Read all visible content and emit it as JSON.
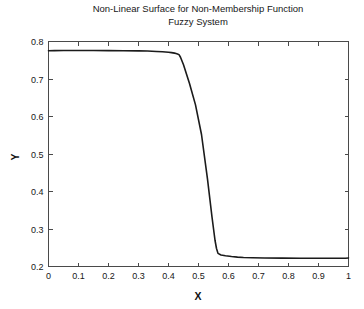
{
  "figure": {
    "background": "#ffffff",
    "width": 364,
    "height": 309
  },
  "chart_data": {
    "type": "line",
    "title": "Non-Linear Surface for Non-Membership Function Fuzzy System",
    "title_lines": [
      "Non-Linear Surface for Non-Membership Function",
      "Fuzzy System"
    ],
    "xlabel": "X",
    "ylabel": "Y",
    "xlim": [
      0,
      1
    ],
    "ylim": [
      0.2,
      0.8
    ],
    "xticks": [
      0,
      0.1,
      0.2,
      0.3,
      0.4,
      0.5,
      0.6,
      0.7,
      0.8,
      0.9,
      1
    ],
    "xticklabels": [
      "0",
      "0.1",
      "0.2",
      "0.3",
      "0.4",
      "0.5",
      "0.6",
      "0.7",
      "0.8",
      "0.9",
      "1"
    ],
    "yticks": [
      0.2,
      0.3,
      0.4,
      0.5,
      0.6,
      0.7,
      0.8
    ],
    "yticklabels": [
      "0.2",
      "0.3",
      "0.4",
      "0.5",
      "0.6",
      "0.7",
      "0.8"
    ],
    "grid": false,
    "legend": null,
    "line_color": "#1b1b1b",
    "series": [
      {
        "name": "non-membership surface",
        "x": [
          0.0,
          0.02,
          0.05,
          0.1,
          0.15,
          0.2,
          0.25,
          0.3,
          0.33,
          0.36,
          0.38,
          0.4,
          0.41,
          0.42,
          0.425,
          0.43,
          0.435,
          0.44,
          0.45,
          0.47,
          0.49,
          0.51,
          0.53,
          0.545,
          0.555,
          0.56,
          0.565,
          0.575,
          0.59,
          0.61,
          0.63,
          0.65,
          0.68,
          0.72,
          0.78,
          0.84,
          0.9,
          0.95,
          0.99,
          1.0
        ],
        "y": [
          0.7755,
          0.7757,
          0.7758,
          0.7758,
          0.7758,
          0.7757,
          0.7755,
          0.775,
          0.7745,
          0.7735,
          0.7726,
          0.7712,
          0.7703,
          0.769,
          0.768,
          0.7668,
          0.765,
          0.758,
          0.738,
          0.688,
          0.631,
          0.552,
          0.433,
          0.332,
          0.27,
          0.248,
          0.235,
          0.2305,
          0.2285,
          0.2265,
          0.225,
          0.224,
          0.2232,
          0.2228,
          0.2224,
          0.2222,
          0.2221,
          0.222,
          0.222,
          0.2228
        ]
      }
    ],
    "plateau_left_value": 0.776,
    "plateau_right_value": 0.222,
    "transition_start_x": 0.435,
    "transition_end_x": 0.565
  }
}
